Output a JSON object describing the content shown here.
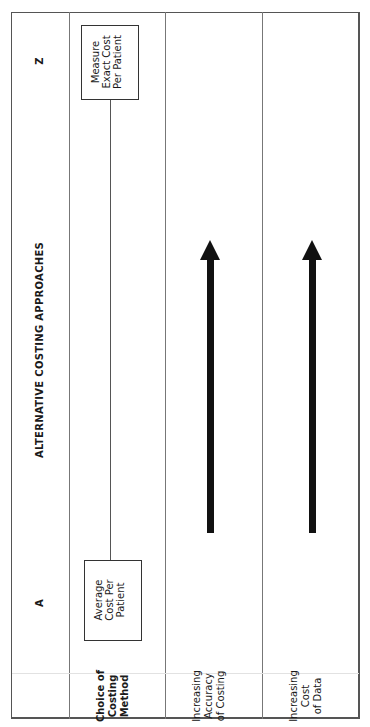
{
  "diagram": {
    "title": "ALTERNATIVE COSTING APPROACHES",
    "scale": {
      "start_label": "A",
      "end_label": "Z"
    },
    "rows": [
      {
        "label": "Choice of\nCosting\nMethod",
        "start_box": "Average\nCost Per\nPatient",
        "end_box": "Measure\nExact Cost\nPer Patient"
      },
      {
        "label": "Increasing\nAccuracy\nof Costing",
        "arrow": "increasing toward Z"
      },
      {
        "label": "Increasing\nCost\nof Data",
        "arrow": "increasing toward Z"
      }
    ],
    "colors": {
      "line": "#777777",
      "arrow": "#111111",
      "text": "#1a1a1a"
    }
  }
}
